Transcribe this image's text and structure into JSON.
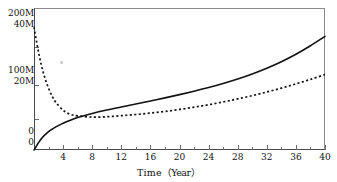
{
  "chart_data": {
    "type": "line",
    "title": "",
    "xlabel": "Time（Year）",
    "ylabel": "",
    "xlim": [
      0,
      40
    ],
    "grid": false,
    "legend": "none",
    "background_color": "#ffffff",
    "axis_color": "#8a8a8a",
    "x_ticks_major": [
      4,
      8,
      12,
      16,
      20,
      24,
      28,
      32,
      36,
      40
    ],
    "x_ticks_minor": [
      2,
      6,
      10,
      14,
      18,
      22,
      26,
      30,
      34,
      38
    ],
    "y_axis_primary": {
      "name": "right-hand scale",
      "tick_labels": [
        "200M",
        "100M",
        "0"
      ],
      "ylim": [
        0,
        200
      ]
    },
    "y_axis_secondary": {
      "name": "left-hand scale",
      "tick_labels": [
        "40M",
        "20M",
        "0"
      ],
      "ylim": [
        0,
        40
      ]
    },
    "y_tick_rows": [
      {
        "top_label": "200M",
        "bottom_label": "40M",
        "y_px": 13
      },
      {
        "top_label": "100M",
        "bottom_label": "20M",
        "y_px": 70
      },
      {
        "top_label": "0",
        "bottom_label": "0",
        "y_px": 131
      }
    ],
    "series": [
      {
        "name": "solid-curve",
        "style": "solid",
        "color": "#111111",
        "x": [
          0,
          1,
          2,
          3,
          4,
          5,
          6,
          8,
          10,
          12,
          14,
          16,
          18,
          20,
          22,
          24,
          26,
          28,
          30,
          32,
          34,
          36,
          38,
          40
        ],
        "values": [
          0,
          5.5,
          9.0,
          11.4,
          13.2,
          14.7,
          16.0,
          18.0,
          19.7,
          21.2,
          22.7,
          24.2,
          25.7,
          27.3,
          29.0,
          30.8,
          32.8,
          35.0,
          37.5,
          40.3,
          43.5,
          47.2,
          51.4,
          56.0
        ]
      },
      {
        "name": "dotted-curve",
        "style": "dotted",
        "color": "#111111",
        "x": [
          0,
          0.5,
          1,
          1.5,
          2,
          2.5,
          3,
          4,
          5,
          6,
          8,
          10,
          12,
          14,
          16,
          18,
          20,
          22,
          24,
          26,
          28,
          30,
          32,
          34,
          36,
          38,
          40
        ],
        "values": [
          60.5,
          50.5,
          42.0,
          35.5,
          30.5,
          26.5,
          23.5,
          19.6,
          17.6,
          16.8,
          16.2,
          16.4,
          16.9,
          17.5,
          18.2,
          19.0,
          20.0,
          21.1,
          22.3,
          23.7,
          25.2,
          26.8,
          28.6,
          30.5,
          32.6,
          34.8,
          37.2
        ]
      }
    ]
  },
  "x_axis": {
    "tick_labels": [
      "4",
      "8",
      "12",
      "16",
      "20",
      "24",
      "28",
      "32",
      "36",
      "40"
    ],
    "title_text": "Time",
    "title_unit": "（Year）"
  },
  "artifacts": {
    "speck_present": true
  }
}
